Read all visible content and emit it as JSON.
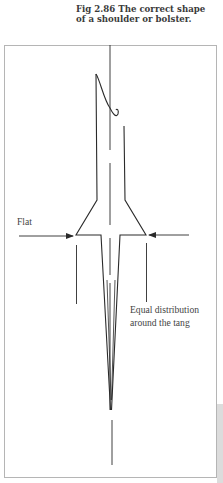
{
  "caption": {
    "line1": "Fig 2.86  The correct shape",
    "line2": "of a shoulder or bolster."
  },
  "labels": {
    "flat": "Flat",
    "equal_line1": "Equal distribution",
    "equal_line2": "around the tang"
  },
  "colors": {
    "line": "#2a2a2a",
    "frame": "#b0b0b0",
    "text": "#444444"
  }
}
